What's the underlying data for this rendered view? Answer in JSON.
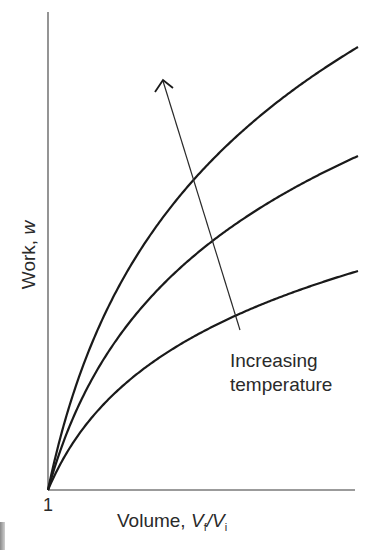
{
  "chart_data": {
    "type": "line",
    "title": "",
    "xlabel": "Volume, Vf/Vi",
    "xlabel_parts": {
      "prefix": "Volume, ",
      "v1": "V",
      "s1": "f",
      "slash": "/",
      "v2": "V",
      "s2": "i"
    },
    "ylabel": "Work, w",
    "ylabel_parts": {
      "prefix": "Work, ",
      "var": "w"
    },
    "x_tick_labels": [
      "1"
    ],
    "grid": false,
    "legend": null,
    "x": [
      1,
      1.25,
      1.5,
      2,
      3,
      4,
      5,
      6,
      7,
      8
    ],
    "series": [
      {
        "name": "Low temperature",
        "relative_scale": 1.0,
        "values": [
          0,
          0.11,
          0.2,
          0.33,
          0.53,
          0.67,
          0.77,
          0.86,
          0.94,
          1.0
        ]
      },
      {
        "name": "Medium temperature",
        "relative_scale": 1.53,
        "values": [
          0,
          0.17,
          0.31,
          0.51,
          0.81,
          1.02,
          1.18,
          1.32,
          1.43,
          1.53
        ]
      },
      {
        "name": "High temperature",
        "relative_scale": 2.02,
        "values": [
          0,
          0.22,
          0.41,
          0.67,
          1.07,
          1.35,
          1.56,
          1.74,
          1.89,
          2.02
        ]
      }
    ],
    "annotations": [
      {
        "text_line1": "Increasing",
        "text_line2": "temperature",
        "type": "arrow",
        "direction": "up-left, crossing curves from low to high T"
      }
    ],
    "axis": {
      "origin_px": [
        48,
        490
      ],
      "x_end_px": 355,
      "y_top_px": 12,
      "curve_end_x_px": 358,
      "curve_end_y_px": [
        271,
        156,
        47
      ]
    },
    "colors": {
      "curve": "#1a1a1a",
      "axis": "#7a7a7a",
      "text": "#2a2a2a"
    }
  }
}
